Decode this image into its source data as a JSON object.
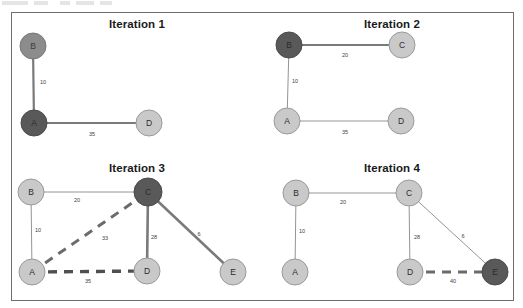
{
  "figure": {
    "title_hidden_artifact": true,
    "border_color": "#6e6e6e",
    "background": "#ffffff",
    "node_colors": {
      "light": "#c9c9c9",
      "light_stroke": "#9a9a9a",
      "mid_dark": "#8c8c8c",
      "dark": "#595959",
      "dark_stroke": "#4a4a4a"
    },
    "edge_colors": {
      "thin": "#8c8c8c",
      "thick": "#7a7a7a",
      "dashed": "#6b6b6b"
    }
  },
  "panels": [
    {
      "id": "iteration-1",
      "title": "Iteration 1",
      "nodes": [
        {
          "id": "B",
          "label": "B",
          "x": 21,
          "y": 33,
          "r": 13,
          "state": "mid_dark"
        },
        {
          "id": "A",
          "label": "A",
          "x": 22,
          "y": 110,
          "r": 13,
          "state": "dark"
        },
        {
          "id": "D",
          "label": "D",
          "x": 137,
          "y": 110,
          "r": 13,
          "state": "light"
        }
      ],
      "edges": [
        {
          "from": "B",
          "to": "A",
          "weight": "10",
          "style": "thick",
          "label_x": 31,
          "label_y": 69
        },
        {
          "from": "A",
          "to": "D",
          "weight": "35",
          "style": "thick",
          "label_x": 80,
          "label_y": 121
        }
      ]
    },
    {
      "id": "iteration-2",
      "title": "Iteration 2",
      "nodes": [
        {
          "id": "B",
          "label": "B",
          "x": 20,
          "y": 32,
          "r": 13,
          "state": "dark"
        },
        {
          "id": "C",
          "label": "C",
          "x": 133,
          "y": 32,
          "r": 13,
          "state": "light"
        },
        {
          "id": "A",
          "label": "A",
          "x": 18,
          "y": 108,
          "r": 13,
          "state": "light"
        },
        {
          "id": "D",
          "label": "D",
          "x": 132,
          "y": 108,
          "r": 13,
          "state": "light"
        }
      ],
      "edges": [
        {
          "from": "B",
          "to": "C",
          "weight": "20",
          "style": "thick",
          "label_x": 76,
          "label_y": 42
        },
        {
          "from": "B",
          "to": "A",
          "weight": "10",
          "style": "thin",
          "label_x": 26,
          "label_y": 68
        },
        {
          "from": "A",
          "to": "D",
          "weight": "35",
          "style": "thin",
          "label_x": 76,
          "label_y": 119
        }
      ]
    },
    {
      "id": "iteration-3",
      "title": "Iteration 3",
      "nodes": [
        {
          "id": "B",
          "label": "B",
          "x": 19,
          "y": 35,
          "r": 13,
          "state": "light"
        },
        {
          "id": "C",
          "label": "C",
          "x": 136,
          "y": 35,
          "r": 14,
          "state": "dark"
        },
        {
          "id": "A",
          "label": "A",
          "x": 20,
          "y": 115,
          "r": 13,
          "state": "light"
        },
        {
          "id": "D",
          "label": "D",
          "x": 135,
          "y": 114,
          "r": 13,
          "state": "light"
        },
        {
          "id": "E",
          "label": "E",
          "x": 221,
          "y": 115,
          "r": 13,
          "state": "light"
        }
      ],
      "edges": [
        {
          "from": "B",
          "to": "C",
          "weight": "20",
          "style": "thin",
          "label_x": 65,
          "label_y": 43
        },
        {
          "from": "B",
          "to": "A",
          "weight": "10",
          "style": "thin",
          "label_x": 26,
          "label_y": 73
        },
        {
          "from": "A",
          "to": "C",
          "weight": "33",
          "style": "dashed",
          "label_x": 93,
          "label_y": 81
        },
        {
          "from": "A",
          "to": "D",
          "weight": "35",
          "style": "dashed",
          "label_x": 76,
          "label_y": 124
        },
        {
          "from": "C",
          "to": "D",
          "weight": "28",
          "style": "thick",
          "label_x": 142,
          "label_y": 80
        },
        {
          "from": "C",
          "to": "E",
          "weight": "6",
          "style": "thick",
          "label_x": 187,
          "label_y": 77
        }
      ]
    },
    {
      "id": "iteration-4",
      "title": "Iteration 4",
      "nodes": [
        {
          "id": "B",
          "label": "B",
          "x": 27,
          "y": 36,
          "r": 13,
          "state": "light"
        },
        {
          "id": "C",
          "label": "C",
          "x": 140,
          "y": 36,
          "r": 13,
          "state": "light"
        },
        {
          "id": "A",
          "label": "A",
          "x": 26,
          "y": 115,
          "r": 13,
          "state": "light"
        },
        {
          "id": "D",
          "label": "D",
          "x": 141,
          "y": 115,
          "r": 13,
          "state": "light"
        },
        {
          "id": "E",
          "label": "E",
          "x": 226,
          "y": 115,
          "r": 13,
          "state": "dark"
        }
      ],
      "edges": [
        {
          "from": "B",
          "to": "C",
          "weight": "20",
          "style": "thin",
          "label_x": 74,
          "label_y": 45
        },
        {
          "from": "B",
          "to": "A",
          "weight": "10",
          "style": "thin",
          "label_x": 33,
          "label_y": 74
        },
        {
          "from": "C",
          "to": "D",
          "weight": "28",
          "style": "thin",
          "label_x": 148,
          "label_y": 80
        },
        {
          "from": "C",
          "to": "E",
          "weight": "6",
          "style": "thin",
          "label_x": 194,
          "label_y": 79
        },
        {
          "from": "D",
          "to": "E",
          "weight": "40",
          "style": "dashed",
          "label_x": 184,
          "label_y": 124
        }
      ]
    }
  ],
  "graph_data": {
    "type": "diagram",
    "description": "Minimum spanning tree / greedy algorithm iterations on a weighted graph",
    "vertices": [
      "A",
      "B",
      "C",
      "D",
      "E"
    ],
    "edge_weights": {
      "A-B": 10,
      "A-C": 33,
      "A-D": 35,
      "B-C": 20,
      "C-D": 28,
      "C-E": 6,
      "D-E": 40
    },
    "iterations": [
      {
        "step": 1,
        "current_node": "A",
        "visited": [
          "A",
          "B"
        ],
        "edges_shown": [
          "A-B",
          "A-D"
        ]
      },
      {
        "step": 2,
        "current_node": "B",
        "visited": [
          "A",
          "B"
        ],
        "edges_shown": [
          "B-C",
          "A-B",
          "A-D"
        ]
      },
      {
        "step": 3,
        "current_node": "C",
        "visited": [
          "A",
          "B",
          "C"
        ],
        "edges_shown": [
          "B-C",
          "A-B",
          "A-C",
          "A-D",
          "C-D",
          "C-E"
        ]
      },
      {
        "step": 4,
        "current_node": "E",
        "visited": [
          "A",
          "B",
          "C",
          "D",
          "E"
        ],
        "edges_shown": [
          "B-C",
          "A-B",
          "C-D",
          "C-E",
          "D-E"
        ]
      }
    ]
  }
}
